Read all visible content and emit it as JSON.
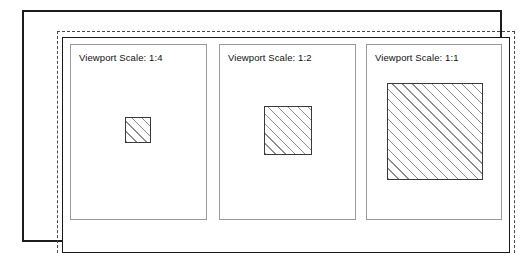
{
  "figure": {
    "outer_frame": "solid-black-border",
    "guide_frame": "dashed-margin-guide",
    "inner_frame": "solid-drawing-area-border"
  },
  "viewports": [
    {
      "id": "viewport-1-4",
      "label": "Viewport Scale:  1:4",
      "scale_text": "1:4",
      "rect_name": "hatched-rectangle-quarter-scale"
    },
    {
      "id": "viewport-1-2",
      "label": "Viewport Scale:  1:2",
      "scale_text": "1:2",
      "rect_name": "hatched-rectangle-half-scale"
    },
    {
      "id": "viewport-1-1",
      "label": "Viewport Scale:  1:1",
      "scale_text": "1:1",
      "rect_name": "hatched-rectangle-full-scale"
    }
  ],
  "colors": {
    "frame_black": "#16181a",
    "panel_gray": "#9a9a9a",
    "hatch_gray": "#8d8d8d",
    "rect_border": "#3a3a3a",
    "dash_gray": "#4a4a4a",
    "background": "#ffffff"
  }
}
